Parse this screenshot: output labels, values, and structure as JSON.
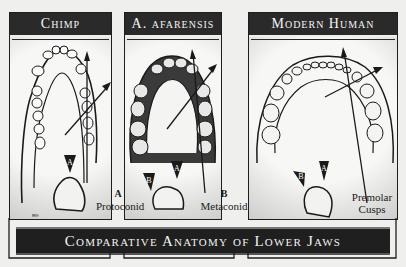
{
  "panels": [
    {
      "name": "chimp",
      "title": "Chimp"
    },
    {
      "name": "afarensis",
      "title": "A. afarensis"
    },
    {
      "name": "modern-human",
      "title": "Modern Human"
    }
  ],
  "cusp_markers": {
    "a": "A",
    "b": "B"
  },
  "legend": {
    "protoconid": {
      "marker": "A",
      "label": "Protoconid"
    },
    "metaconid": {
      "marker": "B",
      "label": "Metaconid"
    },
    "premolar": {
      "line1": "Premolar",
      "line2": "Cusps"
    }
  },
  "banner": {
    "title": "Comparative Anatomy of Lower Jaws"
  },
  "signature": "MH",
  "colors": {
    "ink": "#1a1a1a",
    "paper": "#f7f7f5",
    "banner": "#1f1f1f"
  }
}
